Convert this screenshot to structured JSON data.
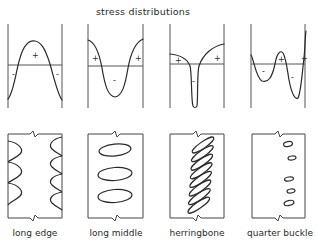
{
  "title": "stress distributions",
  "panels": [
    {
      "id": "long-edge",
      "label": "long edge",
      "stress_profile": "tension in center, compression at both edges",
      "signs": [
        "-",
        "+",
        "-"
      ],
      "buckle_pattern": "waves along both long edges"
    },
    {
      "id": "long-middle",
      "label": "long middle",
      "stress_profile": "tension at both edges, compression in center",
      "signs": [
        "+",
        "-",
        "+"
      ],
      "buckle_pattern": "3 elongated ovals along the middle"
    },
    {
      "id": "herringbone",
      "label": "herringbone",
      "stress_profile": "tension at edges, narrow deep compression near center",
      "signs": [
        "+",
        "-",
        "+"
      ],
      "buckle_pattern": "8 diagonal inclined ovals"
    },
    {
      "id": "quarter-buckle",
      "label": "quarter buckle",
      "stress_profile": "oscillating: compression, tension, compression, tension",
      "signs": [
        "-",
        "+",
        "-",
        "+"
      ],
      "buckle_pattern": "5 small ovals near the quarter line"
    }
  ],
  "colors": {
    "line": "#2a2a2a",
    "axis": "#555555",
    "background": "#ffffff"
  }
}
